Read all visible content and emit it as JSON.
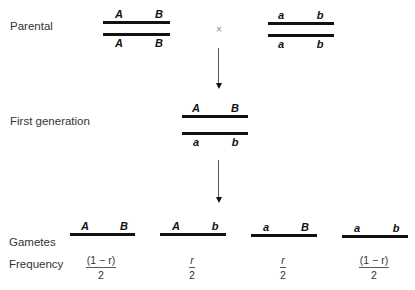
{
  "labels": {
    "parental": "Parental",
    "first_generation": "First generation",
    "gametes": "Gametes",
    "frequency": "Frequency"
  },
  "cross_symbol": "×",
  "parental": {
    "left": {
      "top": [
        "A",
        "B"
      ],
      "bottom": [
        "A",
        "B"
      ]
    },
    "right": {
      "top": [
        "a",
        "b"
      ],
      "bottom": [
        "a",
        "b"
      ]
    }
  },
  "first_generation": {
    "top": [
      "A",
      "B"
    ],
    "bottom": [
      "a",
      "b"
    ]
  },
  "gametes": [
    {
      "alleles": [
        "A",
        "B"
      ],
      "freq_num": "(1 − r)",
      "freq_den": "2"
    },
    {
      "alleles": [
        "A",
        "b"
      ],
      "freq_num": "r",
      "freq_den": "2"
    },
    {
      "alleles": [
        "a",
        "B"
      ],
      "freq_num": "r",
      "freq_den": "2"
    },
    {
      "alleles": [
        "a",
        "b"
      ],
      "freq_num": "(1 − r)",
      "freq_den": "2"
    }
  ]
}
